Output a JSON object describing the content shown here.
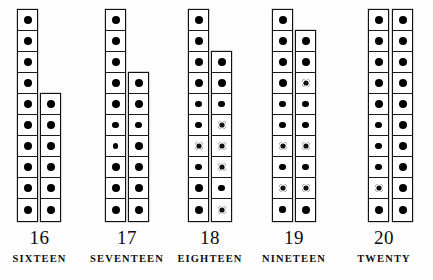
{
  "chart_data": {
    "type": "bar",
    "title": "",
    "subtitle": "",
    "xlabel": "",
    "ylabel": "",
    "categories": [
      "16",
      "17",
      "18",
      "19",
      "20"
    ],
    "values": [
      16,
      17,
      18,
      19,
      20
    ],
    "grid": false,
    "legend": null,
    "series": [
      {
        "name": "left column (tens)",
        "values": [
          10,
          10,
          10,
          10,
          10
        ]
      },
      {
        "name": "right column (units)",
        "values": [
          6,
          7,
          8,
          9,
          10
        ]
      }
    ]
  },
  "sheet": {
    "background_color": "#fdfdfd",
    "ink_color": "#111111",
    "cell_size_px": 21,
    "groups": [
      {
        "id": "group-16",
        "numeral": "16",
        "word": "SIXTEEN",
        "left_px": 2,
        "width_px": 75,
        "columns": [
          {
            "name": "left-column",
            "left_px": 15,
            "count": 10,
            "dots": [
              "solid",
              "solid",
              "solid",
              "solid",
              "solid",
              "solid",
              "solid",
              "solid",
              "solid",
              "solid"
            ]
          },
          {
            "name": "right-column",
            "left_px": 38,
            "count": 6,
            "dots": [
              "solid",
              "solid",
              "solid",
              "solid",
              "solid",
              "solid"
            ]
          }
        ]
      },
      {
        "id": "group-17",
        "numeral": "17",
        "word": "SEVENTEEN",
        "left_px": 88,
        "width_px": 78,
        "columns": [
          {
            "name": "left-column",
            "left_px": 17,
            "count": 10,
            "dots": [
              "solid",
              "solid",
              "solid",
              "solid",
              "solid",
              "small",
              "tiny",
              "solid",
              "solid",
              "solid"
            ]
          },
          {
            "name": "right-column",
            "left_px": 40,
            "count": 7,
            "dots": [
              "solid",
              "solid",
              "small",
              "solid",
              "solid",
              "solid",
              "solid"
            ]
          }
        ]
      },
      {
        "id": "group-18",
        "numeral": "18",
        "word": "EIGHTEEN",
        "left_px": 172,
        "width_px": 76,
        "columns": [
          {
            "name": "left-column",
            "left_px": 16,
            "count": 10,
            "dots": [
              "solid",
              "solid",
              "solid",
              "solid",
              "small",
              "small",
              "faded",
              "small",
              "solid",
              "solid"
            ]
          },
          {
            "name": "right-column",
            "left_px": 39,
            "count": 8,
            "dots": [
              "solid",
              "solid",
              "small",
              "faded",
              "faded",
              "faded",
              "small",
              "faded"
            ]
          }
        ]
      },
      {
        "id": "group-19",
        "numeral": "19",
        "word": "NINETEEN",
        "left_px": 256,
        "width_px": 76,
        "columns": [
          {
            "name": "left-column",
            "left_px": 16,
            "count": 10,
            "dots": [
              "solid",
              "solid",
              "solid",
              "solid",
              "small",
              "small",
              "faded",
              "small",
              "faded",
              "small"
            ]
          },
          {
            "name": "right-column",
            "left_px": 39,
            "count": 9,
            "dots": [
              "solid",
              "solid",
              "faded",
              "small",
              "small",
              "faded",
              "small",
              "faded",
              "solid"
            ]
          }
        ]
      },
      {
        "id": "group-20",
        "numeral": "20",
        "word": "TWENTY",
        "left_px": 346,
        "width_px": 76,
        "columns": [
          {
            "name": "left-column",
            "left_px": 22,
            "count": 10,
            "dots": [
              "solid",
              "solid",
              "solid",
              "solid",
              "solid",
              "small",
              "small",
              "small",
              "faded",
              "solid"
            ]
          },
          {
            "name": "right-column",
            "left_px": 46,
            "count": 10,
            "dots": [
              "solid",
              "solid",
              "solid",
              "solid",
              "solid",
              "solid",
              "solid",
              "solid",
              "solid",
              "solid"
            ]
          }
        ]
      }
    ]
  }
}
